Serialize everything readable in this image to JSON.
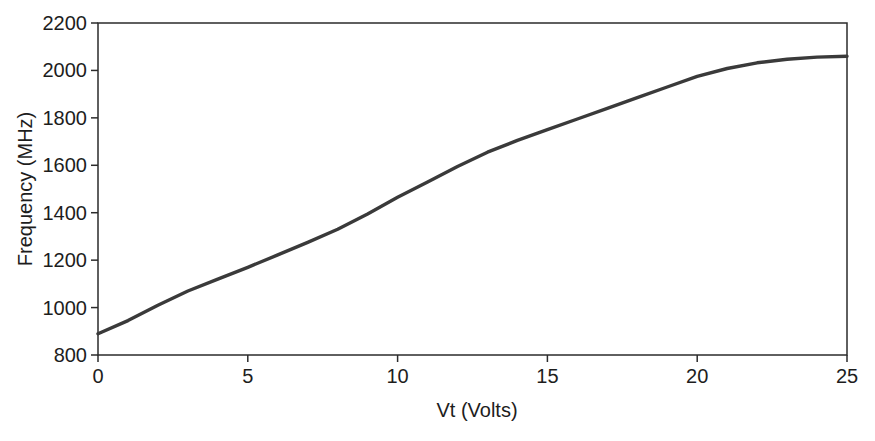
{
  "chart_data": {
    "type": "line",
    "title": "",
    "xlabel": "Vt (Volts)",
    "ylabel": "Frequency (MHz)",
    "x": [
      0,
      1,
      2,
      3,
      4,
      5,
      6,
      7,
      8,
      9,
      10,
      11,
      12,
      13,
      14,
      15,
      16,
      17,
      18,
      19,
      20,
      21,
      22,
      23,
      24,
      25
    ],
    "y": [
      890,
      945,
      1010,
      1070,
      1120,
      1170,
      1222,
      1275,
      1330,
      1395,
      1465,
      1530,
      1595,
      1655,
      1705,
      1750,
      1795,
      1840,
      1885,
      1930,
      1975,
      2008,
      2032,
      2047,
      2056,
      2060
    ],
    "xlim": [
      0,
      25
    ],
    "ylim": [
      800,
      2200
    ],
    "xticks": [
      0,
      5,
      10,
      15,
      20,
      25
    ],
    "yticks": [
      800,
      1000,
      1200,
      1400,
      1600,
      1800,
      2000,
      2200
    ],
    "grid": false,
    "legend": "none",
    "series_name": "Frequency vs tuning voltage",
    "line_color": "#3a3a3a",
    "line_width": 3.4,
    "axis_color": "#2b2b2b",
    "background": "#ffffff"
  }
}
